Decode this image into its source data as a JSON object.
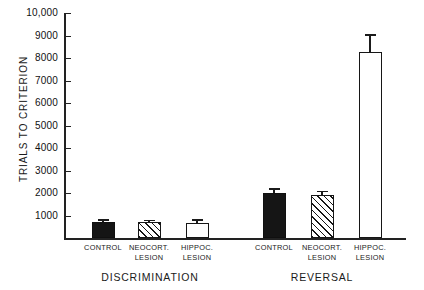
{
  "chart_data": {
    "type": "bar",
    "title": "",
    "xlabel": "",
    "ylabel": "TRIALS TO CRITERION",
    "ylim": [
      0,
      10000
    ],
    "grid": false,
    "legend_position": "none",
    "ytick_labels": [
      "10,000",
      "9000",
      "8000",
      "7000",
      "6000",
      "5000",
      "4000",
      "3000",
      "2000",
      "1000"
    ],
    "ytick_values": [
      10000,
      9000,
      8000,
      7000,
      6000,
      5000,
      4000,
      3000,
      2000,
      1000
    ],
    "groups": [
      {
        "name": "DISCRIMINATION",
        "bars": [
          {
            "label_line1": "CONTROL",
            "label_line2": "",
            "value": 700,
            "error": 130,
            "style": "solid"
          },
          {
            "label_line1": "NEOCORT.",
            "label_line2": "LESION",
            "value": 700,
            "error": 120,
            "style": "hatch"
          },
          {
            "label_line1": "HIPPOC.",
            "label_line2": "LESION",
            "value": 680,
            "error": 150,
            "style": "open"
          }
        ]
      },
      {
        "name": "REVERSAL",
        "bars": [
          {
            "label_line1": "CONTROL",
            "label_line2": "",
            "value": 2000,
            "error": 220,
            "style": "solid"
          },
          {
            "label_line1": "NEOCORT.",
            "label_line2": "LESION",
            "value": 1900,
            "error": 200,
            "style": "hatch"
          },
          {
            "label_line1": "HIPPOC.",
            "label_line2": "LESION",
            "value": 8250,
            "error": 800,
            "style": "open"
          }
        ]
      }
    ],
    "colors": {
      "solid_fill": "#151515",
      "open_fill": "#ffffff",
      "outline": "#161616",
      "axis": "#222222",
      "text": "#1a1a1a",
      "background": "#ffffff"
    }
  }
}
